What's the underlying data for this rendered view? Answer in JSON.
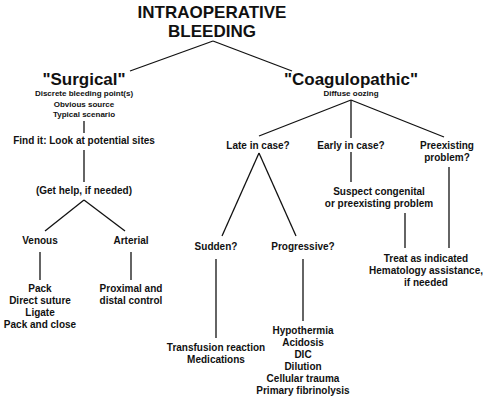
{
  "title": {
    "line1": "INTRAOPERATIVE",
    "line2": "BLEEDING"
  },
  "surgical": {
    "label": "\"Surgical\"",
    "details": [
      "Discrete bleeding point(s)",
      "Obvious source",
      "Typical scenario"
    ],
    "find_it": "Find it: Look at potential sites",
    "get_help": "(Get help, if needed)",
    "venous": {
      "label": "Venous",
      "actions": [
        "Pack",
        "Direct suture",
        "Ligate",
        "Pack and close"
      ]
    },
    "arterial": {
      "label": "Arterial",
      "actions": [
        "Proximal and",
        "distal control"
      ]
    }
  },
  "coagulopathic": {
    "label": "\"Coagulopathic\"",
    "details": [
      "Diffuse oozing"
    ],
    "late": {
      "label": "Late in case?",
      "sudden": {
        "label": "Sudden?",
        "causes": [
          "Transfusion reaction",
          "Medications"
        ]
      },
      "progressive": {
        "label": "Progressive?",
        "causes": [
          "Hypothermia",
          "Acidosis",
          "DIC",
          "Dilution",
          "Cellular trauma",
          "Primary fibrinolysis"
        ]
      }
    },
    "early": {
      "label": "Early in case?",
      "suspect": [
        "Suspect congenital",
        "or preexisting problem"
      ]
    },
    "preexisting": {
      "label": [
        "Preexisting",
        "problem?"
      ]
    },
    "treat": [
      "Treat as indicated",
      "Hematology assistance,",
      "if needed"
    ]
  }
}
